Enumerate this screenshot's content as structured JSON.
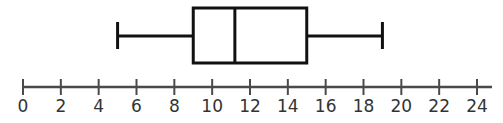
{
  "chart_data": {
    "type": "boxplot",
    "title": "",
    "xlabel": "",
    "ylabel": "",
    "orientation": "horizontal",
    "xlim": [
      0,
      24
    ],
    "ticks": [
      0,
      2,
      4,
      6,
      8,
      10,
      12,
      14,
      16,
      18,
      20,
      22,
      24
    ],
    "tick_labels": [
      "0",
      "2",
      "4",
      "6",
      "8",
      "10",
      "12",
      "14",
      "16",
      "18",
      "20",
      "22",
      "24"
    ],
    "grid": false,
    "legend": null,
    "series": [
      {
        "name": "",
        "min": 5,
        "q1": 9,
        "median": 11.2,
        "q3": 15,
        "max": 19
      }
    ]
  },
  "colors": {
    "box_stroke": "#111111",
    "axis_stroke": "#4a4a4a",
    "label_text": "#333333",
    "background": "#ffffff"
  }
}
